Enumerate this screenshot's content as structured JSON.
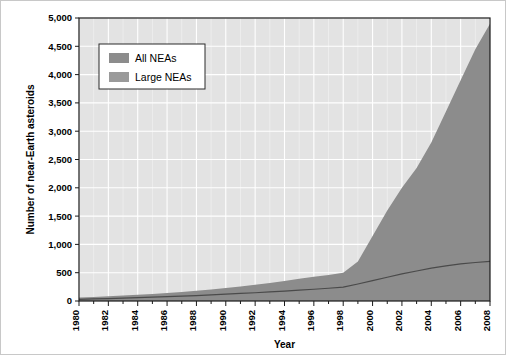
{
  "chart_data": {
    "type": "area",
    "title": "",
    "xlabel": "Year",
    "ylabel": "Number of near-Earth asteroids",
    "xlim": [
      1980,
      2008
    ],
    "ylim": [
      0,
      5000
    ],
    "grid": true,
    "legend_position": "top-left",
    "x": [
      1980,
      1981,
      1982,
      1983,
      1984,
      1985,
      1986,
      1987,
      1988,
      1989,
      1990,
      1991,
      1992,
      1993,
      1994,
      1995,
      1996,
      1997,
      1998,
      1999,
      2000,
      2001,
      2002,
      2003,
      2004,
      2005,
      2006,
      2007,
      2008
    ],
    "xtick_labels": [
      "1980",
      "1982",
      "1984",
      "1986",
      "1988",
      "1990",
      "1992",
      "1994",
      "1996",
      "1998",
      "2000",
      "2002",
      "2004",
      "2006",
      "2008"
    ],
    "xticks": [
      1980,
      1982,
      1984,
      1986,
      1988,
      1990,
      1992,
      1994,
      1996,
      1998,
      2000,
      2002,
      2004,
      2006,
      2008
    ],
    "ytick_labels": [
      "0",
      "500",
      "1,000",
      "1,500",
      "2,000",
      "2,500",
      "3,000",
      "3,500",
      "4,000",
      "4,500",
      "5,000"
    ],
    "yticks": [
      0,
      500,
      1000,
      1500,
      2000,
      2500,
      3000,
      3500,
      4000,
      4500,
      5000
    ],
    "series": [
      {
        "name": "All NEAs",
        "kind": "area",
        "color": "#8c8c8c",
        "values": [
          60,
          70,
          82,
          95,
          110,
          125,
          142,
          160,
          180,
          205,
          230,
          258,
          288,
          320,
          355,
          395,
          430,
          460,
          500,
          700,
          1150,
          1600,
          2000,
          2350,
          2800,
          3350,
          3900,
          4450,
          4900
        ]
      },
      {
        "name": "Large NEAs",
        "kind": "line",
        "color": "#4a4a4a",
        "values": [
          30,
          36,
          43,
          50,
          58,
          67,
          76,
          86,
          96,
          108,
          120,
          133,
          146,
          160,
          175,
          192,
          208,
          225,
          245,
          300,
          360,
          420,
          480,
          530,
          580,
          620,
          655,
          680,
          700
        ]
      }
    ],
    "colors": {
      "plot_background": "#e3e3e3",
      "gridline": "#ffffff",
      "axis": "#1a1a1a",
      "figure_background": "#ffffff",
      "area_fill": "#8c8c8c",
      "line_stroke": "#4a4a4a",
      "legend_background": "#ffffff",
      "legend_border": "#2b2b2b"
    }
  },
  "legend": {
    "items": [
      {
        "label": "All NEAs",
        "swatch_color": "#8c8c8c"
      },
      {
        "label": "Large NEAs",
        "swatch_color": "#9a9a9a"
      }
    ]
  },
  "axes": {
    "x_title": "Year",
    "y_title": "Number of near-Earth asteroids"
  }
}
